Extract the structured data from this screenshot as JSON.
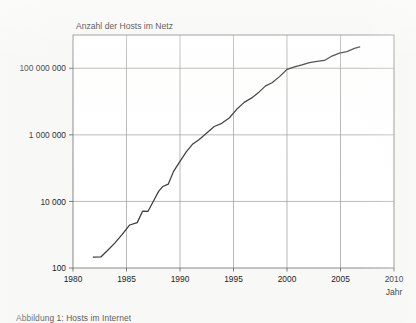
{
  "figure": {
    "background_color": "#f8f8f6",
    "plot_background_color": "#ffffff",
    "frame_color": "#7c7c7c",
    "grid_color": "#9a9a9a",
    "line_color": "#3a3a3a",
    "caption": "Abbildung 1: Hosts im Internet"
  },
  "chart_data": {
    "type": "line",
    "title": "Anzahl der Hosts im Netz",
    "xlabel": "Jahr",
    "ylabel": "",
    "yscale": "log",
    "xlim": [
      1980,
      2010
    ],
    "ylim": [
      100,
      1000000000
    ],
    "grid": true,
    "legend": "none",
    "xticks": [
      1980,
      1985,
      1990,
      1995,
      2000,
      2005,
      2010
    ],
    "xtick_labels": [
      "1980",
      "1985",
      "1990",
      "1995",
      "2000",
      "2005",
      "2010"
    ],
    "yticks": [
      100,
      10000,
      1000000,
      100000000
    ],
    "ytick_labels": [
      "100",
      "10 000",
      "1 000 000",
      "100 000 000"
    ],
    "series": [
      {
        "name": "Hosts im Netz",
        "color": "#3a3a3a",
        "x": [
          1981.9,
          1982.6,
          1983.2,
          1983.9,
          1984.6,
          1985.3,
          1986.0,
          1986.5,
          1987.0,
          1987.5,
          1988.0,
          1988.4,
          1988.9,
          1989.4,
          1990.0,
          1990.6,
          1991.2,
          1991.8,
          1992.5,
          1993.2,
          1993.9,
          1994.6,
          1995.3,
          1996.0,
          1996.7,
          1997.4,
          1998.0,
          1998.6,
          1999.3,
          2000.0,
          2000.7,
          2001.4,
          2002.1,
          2002.8,
          2003.5,
          2004.2,
          2004.9,
          2005.6,
          2006.3,
          2006.8
        ],
        "y": [
          213,
          215,
          330,
          560,
          1024,
          1961,
          2308,
          5089,
          5000,
          10000,
          20000,
          28174,
          33000,
          80000,
          159000,
          313000,
          535000,
          727000,
          1136000,
          1776000,
          2217000,
          3212000,
          5846000,
          9472000,
          12881000,
          19540000,
          29670000,
          36739000,
          56218000,
          93047000,
          109574000,
          125888000,
          147345000,
          162128000,
          171638000,
          233101000,
          285139000,
          317646000,
          394992000,
          439286000
        ]
      }
    ],
    "annotations": []
  }
}
